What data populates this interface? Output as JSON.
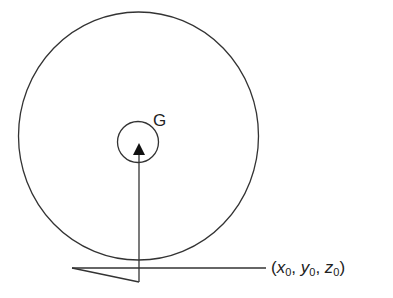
{
  "diagram": {
    "title": "",
    "labels": {
      "center_of_mass": "G",
      "point": {
        "x": "x",
        "x_sub": "0",
        "y": "y",
        "y_sub": "0",
        "z": "z",
        "z_sub": "0",
        "open": "(",
        "sep": ", ",
        "close": ")"
      }
    },
    "elements": [
      {
        "type": "ellipse",
        "name": "outer-circle",
        "cx": 138.5,
        "cy": 136,
        "rx": 120,
        "ry": 124
      },
      {
        "type": "circle",
        "name": "inner-circle",
        "cx": 138,
        "cy": 142,
        "r": 20
      },
      {
        "type": "arrow",
        "name": "vertical-arrow",
        "from": [
          139,
          282
        ],
        "to": [
          139,
          143
        ]
      },
      {
        "type": "line",
        "name": "horizontal-line",
        "from": [
          72,
          268
        ],
        "to": [
          266,
          268
        ]
      },
      {
        "type": "line",
        "name": "wedge-line",
        "from": [
          72,
          268
        ],
        "to": [
          139,
          282
        ]
      }
    ],
    "stroke_color": "#333333"
  }
}
